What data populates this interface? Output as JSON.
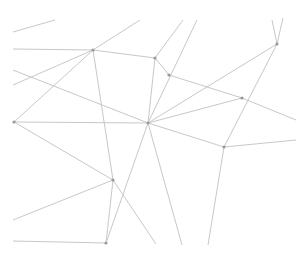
{
  "diagram": {
    "type": "network-graph",
    "background": "#ffffff",
    "edge_color": "#c8c8c8",
    "node_color": "#9a9a9a",
    "nodes": [
      {
        "id": "A",
        "x": 93,
        "y": 50
      },
      {
        "id": "B",
        "x": 155,
        "y": 58
      },
      {
        "id": "C",
        "x": 169,
        "y": 75
      },
      {
        "id": "D",
        "x": 14,
        "y": 122
      },
      {
        "id": "E",
        "x": 148,
        "y": 123
      },
      {
        "id": "F",
        "x": 242,
        "y": 98
      },
      {
        "id": "G",
        "x": 277,
        "y": 44
      },
      {
        "id": "H",
        "x": 224,
        "y": 147
      },
      {
        "id": "I",
        "x": 113,
        "y": 180
      },
      {
        "id": "J",
        "x": 106,
        "y": 243
      }
    ],
    "edges": [
      [
        13,
        32,
        55,
        20
      ],
      [
        13,
        49,
        93,
        50
      ],
      [
        93,
        50,
        155,
        58
      ],
      [
        93,
        50,
        140,
        20
      ],
      [
        13,
        85,
        93,
        50
      ],
      [
        93,
        50,
        14,
        122
      ],
      [
        93,
        50,
        113,
        180
      ],
      [
        13,
        70,
        148,
        123
      ],
      [
        14,
        122,
        148,
        123
      ],
      [
        14,
        122,
        113,
        180
      ],
      [
        155,
        58,
        183,
        20
      ],
      [
        148,
        123,
        197,
        20
      ],
      [
        155,
        58,
        169,
        75
      ],
      [
        155,
        58,
        148,
        123
      ],
      [
        169,
        75,
        242,
        98
      ],
      [
        242,
        98,
        296,
        120
      ],
      [
        148,
        123,
        242,
        98
      ],
      [
        148,
        123,
        277,
        44
      ],
      [
        277,
        44,
        272,
        20
      ],
      [
        277,
        44,
        283,
        18
      ],
      [
        277,
        44,
        224,
        147
      ],
      [
        224,
        147,
        296,
        140
      ],
      [
        148,
        123,
        224,
        147
      ],
      [
        224,
        147,
        208,
        245
      ],
      [
        148,
        123,
        182,
        245
      ],
      [
        148,
        123,
        106,
        243
      ],
      [
        113,
        180,
        106,
        243
      ],
      [
        113,
        180,
        156,
        244
      ],
      [
        113,
        180,
        13,
        220
      ],
      [
        13,
        241,
        106,
        243
      ]
    ]
  }
}
